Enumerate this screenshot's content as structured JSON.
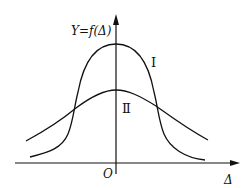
{
  "figure": {
    "y_axis_label": "Y=f(Δ)",
    "x_axis_label": "Δ",
    "origin_label": "O",
    "curves": [
      {
        "name": "curve-I",
        "label": "Ⅰ",
        "description": "narrow, tall distribution"
      },
      {
        "name": "curve-II",
        "label": "Ⅱ",
        "description": "wide, flat distribution"
      }
    ],
    "colors": {
      "ink": "#111111",
      "background": "#ffffff"
    }
  }
}
